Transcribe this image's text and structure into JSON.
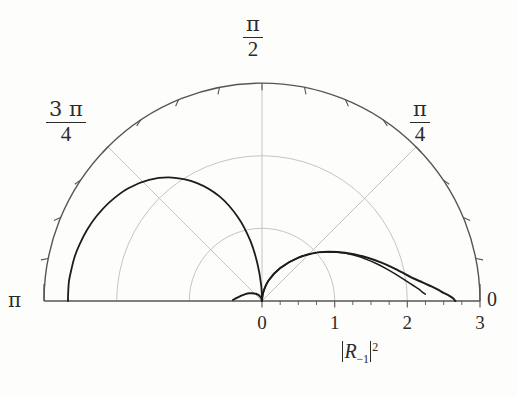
{
  "figure": {
    "kind": "polar-half-plane-plot",
    "background": "#fdfdfc",
    "grid_color": "#b9b9b9",
    "axis_color": "#4a4a4a",
    "curve_color": "#1c1c1c"
  },
  "angular_labels": {
    "pi_half_num": "π",
    "pi_half_den": "2",
    "three_pi_quarter_num": "3 π",
    "three_pi_quarter_den": "4",
    "pi_quarter_num": "π",
    "pi_quarter_den": "4",
    "pi": "π",
    "zero": "0"
  },
  "axis": {
    "title_open_bar": "|",
    "title_symbol": "R",
    "title_subscript": "−1",
    "title_close_bar": "|",
    "title_superscript": "2",
    "title_plain": "|R−₁|²"
  },
  "chart_data": {
    "type": "line",
    "coordinate_system": "polar-upper-half",
    "title": "",
    "xlabel": "|R−₁|²",
    "ylabel": "",
    "grid": true,
    "legend": "none",
    "radial_axis": {
      "label": "|R−₁|²",
      "ticks": [
        0,
        1,
        2,
        3
      ],
      "tick_labels": [
        "0",
        "1",
        "2",
        "3"
      ],
      "minor_ticks_per_interval": 4,
      "rlim": [
        0,
        3
      ],
      "grid_circles": [
        1,
        2,
        3
      ]
    },
    "angular_axis": {
      "labeled_ticks": [
        0,
        0.7853981634,
        1.5707963268,
        2.3561944902,
        3.1415926536
      ],
      "tick_labels": [
        "0",
        "π/4",
        "π/2",
        "3π/4",
        "π"
      ],
      "theta_range_deg": [
        0,
        180
      ],
      "minor_tick_step_deg": 11.25,
      "radial_spokes_deg": [
        45,
        90,
        135
      ]
    },
    "series": [
      {
        "name": "left-branch-upper",
        "description": "Curve rising from origin, plateauing near r=2.65 toward theta=pi",
        "theta_deg": [
          90,
          93,
          97,
          101,
          106,
          112,
          119,
          126,
          133,
          140,
          147,
          153,
          158,
          163,
          167,
          171,
          174,
          176.5,
          178.5,
          180
        ],
        "r": [
          0.0,
          0.22,
          0.52,
          0.85,
          1.2,
          1.55,
          1.86,
          2.1,
          2.28,
          2.41,
          2.5,
          2.56,
          2.6,
          2.63,
          2.65,
          2.66,
          2.67,
          2.67,
          2.67,
          2.67
        ]
      },
      {
        "name": "right-branch-outer",
        "description": "Lobe from origin peaking near r=1.45 around theta=7deg then decaying to r~0 at theta=0",
        "theta_deg": [
          90,
          82,
          72,
          61,
          50,
          41,
          33,
          27,
          22,
          18,
          14.5,
          11.5,
          9,
          7,
          5.2,
          3.8,
          2.6,
          1.6,
          0.8,
          0.0
        ],
        "r": [
          0.0,
          0.12,
          0.3,
          0.52,
          0.78,
          1.02,
          1.24,
          1.42,
          1.58,
          1.72,
          1.85,
          1.97,
          2.08,
          2.2,
          2.32,
          2.42,
          2.5,
          2.58,
          2.63,
          2.66
        ]
      },
      {
        "name": "right-branch-inner",
        "description": "Second nearly-coincident lobe terminating near r=2.25",
        "theta_deg": [
          90,
          82,
          72,
          61,
          50,
          41,
          33,
          27,
          22,
          18,
          14.5,
          11.5,
          9,
          7,
          5.5,
          4.2,
          3.2,
          2.4
        ],
        "r": [
          0.0,
          0.12,
          0.3,
          0.52,
          0.78,
          1.02,
          1.23,
          1.4,
          1.54,
          1.66,
          1.77,
          1.87,
          1.96,
          2.04,
          2.11,
          2.17,
          2.21,
          2.25
        ]
      },
      {
        "name": "small-left-foot",
        "description": "Short low arc just left of the origin hugging the theta=pi axis direction",
        "theta_deg": [
          90,
          110,
          130,
          148,
          160,
          168,
          173,
          176,
          178
        ],
        "r": [
          0.0,
          0.06,
          0.13,
          0.2,
          0.26,
          0.31,
          0.35,
          0.38,
          0.4
        ]
      }
    ]
  }
}
